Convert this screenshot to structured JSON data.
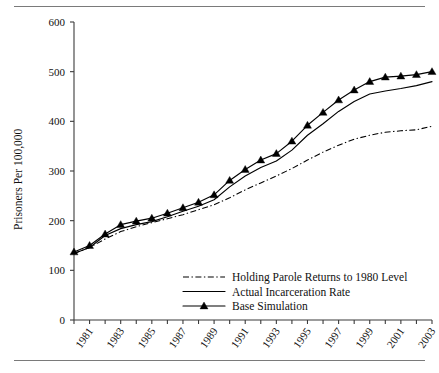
{
  "figure": {
    "rule_top_label": "top-divider",
    "rule_bottom_label": "bottom-divider"
  },
  "chart_data": {
    "type": "line",
    "title": "",
    "xlabel": "",
    "ylabel": "Prisoners Per 100,000",
    "xlim": [
      1980,
      2003
    ],
    "ylim": [
      0,
      600
    ],
    "yticks": [
      0,
      100,
      200,
      300,
      400,
      500,
      600
    ],
    "ytick_labels": [
      "0",
      "100",
      "200",
      "300",
      "400",
      "500",
      "600"
    ],
    "x": [
      1980,
      1981,
      1982,
      1983,
      1984,
      1985,
      1986,
      1987,
      1988,
      1989,
      1990,
      1991,
      1992,
      1993,
      1994,
      1995,
      1996,
      1997,
      1998,
      1999,
      2000,
      2001,
      2002,
      2003
    ],
    "xtick_labels": [
      "1981",
      "1983",
      "1985",
      "1987",
      "1989",
      "1991",
      "1993",
      "1995",
      "1997",
      "1999",
      "2001",
      "2003"
    ],
    "xtick_years": [
      1981,
      1983,
      1985,
      1987,
      1989,
      1991,
      1993,
      1995,
      1997,
      1999,
      2001,
      2003
    ],
    "grid": false,
    "legend_position": "lower center",
    "series": [
      {
        "name": "Holding Parole Returns to 1980 Level",
        "style": "dash-dot",
        "marker": "none",
        "values": [
          134,
          146,
          163,
          178,
          188,
          196,
          204,
          212,
          222,
          232,
          246,
          262,
          276,
          290,
          305,
          322,
          338,
          352,
          364,
          372,
          378,
          381,
          383,
          390
        ]
      },
      {
        "name": "Actual Incarceration Rate",
        "style": "solid",
        "marker": "none",
        "values": [
          134,
          146,
          170,
          184,
          192,
          198,
          208,
          219,
          229,
          242,
          268,
          290,
          307,
          320,
          342,
          372,
          395,
          420,
          440,
          455,
          461,
          466,
          472,
          480
        ]
      },
      {
        "name": "Base Simulation",
        "style": "solid",
        "marker": "triangle",
        "values": [
          137,
          150,
          173,
          192,
          199,
          205,
          215,
          226,
          237,
          252,
          281,
          303,
          322,
          335,
          360,
          392,
          418,
          443,
          463,
          480,
          489,
          491,
          494,
          500
        ]
      }
    ]
  },
  "legend": {
    "entries": [
      {
        "label": "Holding Parole Returns to 1980 Level",
        "style": "dash-dot",
        "marker": "none"
      },
      {
        "label": "Actual Incarceration Rate",
        "style": "solid",
        "marker": "none"
      },
      {
        "label": "Base Simulation",
        "style": "solid",
        "marker": "triangle"
      }
    ]
  },
  "colors": {
    "line": "#000000",
    "axis": "#3b3b3b",
    "rule": "#7a7a7a",
    "background": "#ffffff"
  }
}
